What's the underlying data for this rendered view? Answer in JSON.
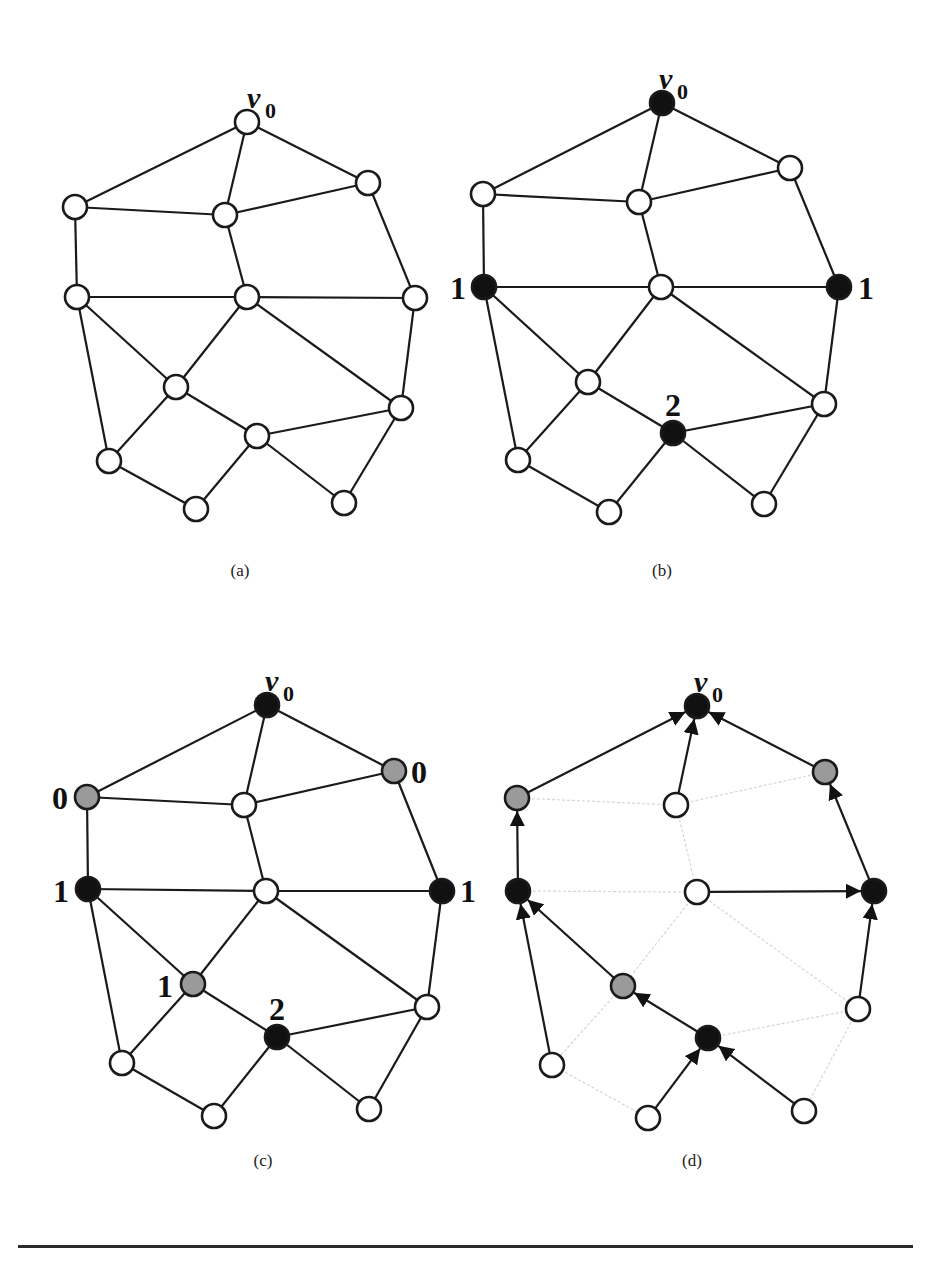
{
  "figure": {
    "node_radius": 12,
    "colors": {
      "white": "#ffffff",
      "black": "#111111",
      "gray": "#9a9a9a",
      "edge": "#1a1a1a",
      "faint_edge": "#d6d6d6"
    },
    "root_label": "v",
    "root_subscript": "0",
    "edges": [
      [
        "v0",
        "A"
      ],
      [
        "v0",
        "B"
      ],
      [
        "v0",
        "C"
      ],
      [
        "A",
        "B"
      ],
      [
        "B",
        "C"
      ],
      [
        "A",
        "D"
      ],
      [
        "B",
        "E"
      ],
      [
        "C",
        "F"
      ],
      [
        "D",
        "E"
      ],
      [
        "E",
        "F"
      ],
      [
        "D",
        "G"
      ],
      [
        "D",
        "J"
      ],
      [
        "E",
        "G"
      ],
      [
        "E",
        "H"
      ],
      [
        "F",
        "H"
      ],
      [
        "G",
        "I"
      ],
      [
        "G",
        "J"
      ],
      [
        "I",
        "H"
      ],
      [
        "I",
        "K"
      ],
      [
        "I",
        "L"
      ],
      [
        "J",
        "K"
      ],
      [
        "H",
        "L"
      ]
    ],
    "panels": [
      {
        "id": "a",
        "caption": "(a)",
        "caption_pos": [
          240,
          576
        ],
        "nodes": {
          "v0": [
            247,
            122,
            "white"
          ],
          "A": [
            75,
            207,
            "white"
          ],
          "B": [
            225,
            215,
            "white"
          ],
          "C": [
            368,
            183,
            "white"
          ],
          "D": [
            77,
            297,
            "white"
          ],
          "E": [
            247,
            297,
            "white"
          ],
          "F": [
            415,
            298,
            "white"
          ],
          "G": [
            176,
            387,
            "white"
          ],
          "H": [
            401,
            408,
            "white"
          ],
          "I": [
            257,
            436,
            "white"
          ],
          "J": [
            109,
            461,
            "white"
          ],
          "K": [
            196,
            509,
            "white"
          ],
          "L": [
            344,
            503,
            "white"
          ]
        },
        "labels": []
      },
      {
        "id": "b",
        "caption": "(b)",
        "caption_pos": [
          662,
          576
        ],
        "nodes": {
          "v0": [
            662,
            103,
            "black"
          ],
          "A": [
            483,
            194,
            "white"
          ],
          "B": [
            639,
            202,
            "white"
          ],
          "C": [
            790,
            168,
            "white"
          ],
          "D": [
            484,
            287,
            "black"
          ],
          "E": [
            661,
            287,
            "white"
          ],
          "F": [
            839,
            287,
            "black"
          ],
          "G": [
            588,
            382,
            "white"
          ],
          "H": [
            824,
            404,
            "white"
          ],
          "I": [
            673,
            433,
            "black"
          ],
          "J": [
            518,
            460,
            "white"
          ],
          "K": [
            609,
            512,
            "white"
          ],
          "L": [
            764,
            504,
            "white"
          ]
        },
        "labels": [
          {
            "text": "1",
            "x": 458,
            "y": 299
          },
          {
            "text": "1",
            "x": 866,
            "y": 299
          },
          {
            "text": "2",
            "x": 673,
            "y": 416
          }
        ]
      },
      {
        "id": "c",
        "caption": "(c)",
        "caption_pos": [
          263,
          1166
        ],
        "nodes": {
          "v0": [
            267,
            705,
            "black"
          ],
          "A": [
            87,
            797,
            "white_gray"
          ],
          "B": [
            244,
            805,
            "white"
          ],
          "C": [
            394,
            771,
            "gray"
          ],
          "D": [
            88,
            889,
            "black"
          ],
          "E": [
            266,
            891,
            "white"
          ],
          "F": [
            442,
            891,
            "black"
          ],
          "G": [
            193,
            984,
            "gray"
          ],
          "H": [
            427,
            1007,
            "white"
          ],
          "I": [
            277,
            1037,
            "black"
          ],
          "J": [
            122,
            1063,
            "white"
          ],
          "K": [
            214,
            1116,
            "white"
          ],
          "L": [
            369,
            1109,
            "white"
          ]
        },
        "labels": [
          {
            "text": "0",
            "x": 60,
            "y": 809
          },
          {
            "text": "0",
            "x": 419,
            "y": 783
          },
          {
            "text": "1",
            "x": 61,
            "y": 902
          },
          {
            "text": "1",
            "x": 468,
            "y": 902
          },
          {
            "text": "1",
            "x": 165,
            "y": 997
          },
          {
            "text": "2",
            "x": 277,
            "y": 1020
          }
        ]
      },
      {
        "id": "d",
        "caption": "(d)",
        "caption_pos": [
          692,
          1166
        ],
        "nodes": {
          "v0": [
            697,
            706,
            "black"
          ],
          "A": [
            517,
            798,
            "gray"
          ],
          "B": [
            676,
            805,
            "white"
          ],
          "C": [
            825,
            772,
            "gray"
          ],
          "D": [
            518,
            891,
            "black"
          ],
          "E": [
            697,
            892,
            "white"
          ],
          "F": [
            874,
            891,
            "black"
          ],
          "G": [
            623,
            986,
            "gray"
          ],
          "H": [
            858,
            1009,
            "white"
          ],
          "I": [
            708,
            1038,
            "black"
          ],
          "J": [
            552,
            1065,
            "white"
          ],
          "K": [
            648,
            1118,
            "white"
          ],
          "L": [
            804,
            1111,
            "white"
          ]
        },
        "tree_edges": [
          [
            "A",
            "v0"
          ],
          [
            "B",
            "v0"
          ],
          [
            "C",
            "v0"
          ],
          [
            "D",
            "A"
          ],
          [
            "E",
            "F"
          ],
          [
            "F",
            "C"
          ],
          [
            "G",
            "D"
          ],
          [
            "J",
            "D"
          ],
          [
            "H",
            "F"
          ],
          [
            "I",
            "G"
          ],
          [
            "K",
            "I"
          ],
          [
            "L",
            "I"
          ]
        ],
        "labels": []
      }
    ],
    "root_label_offsets": {
      "a": [
        263,
        108
      ],
      "b": [
        675,
        89
      ],
      "c": [
        281,
        691
      ],
      "d": [
        710,
        692
      ]
    }
  }
}
